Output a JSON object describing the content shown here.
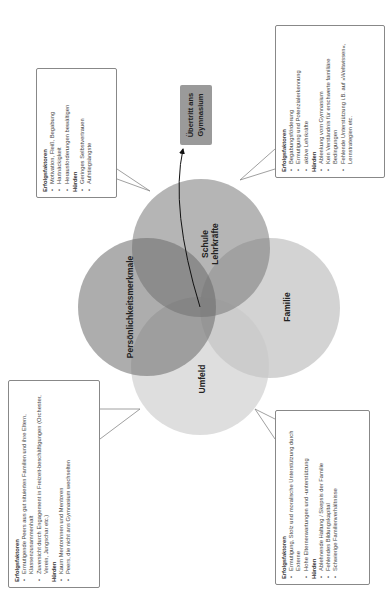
{
  "diagram": {
    "target": "Übertritt ans Gymnasium",
    "target_lines": [
      "Übertritt ans",
      "Gymnasium"
    ],
    "circles": [
      {
        "id": "schule",
        "label_lines": [
          "Schule",
          "Lehrkräfte"
        ]
      },
      {
        "id": "persoenlichkeit",
        "label_lines": [
          "Persönlichkeitsmerkmale"
        ]
      },
      {
        "id": "familie",
        "label_lines": [
          "Familie"
        ]
      },
      {
        "id": "umfeld",
        "label_lines": [
          "Umfeld"
        ]
      }
    ],
    "callouts": {
      "persoenlichkeit": {
        "success_heading": "Erfolgsfaktoren",
        "success": [
          "Motivation, Fleiß, Begabung",
          "Hartnäckigkeit",
          "Herausforderungen bewältigen"
        ],
        "obstacles_heading": "Hürden",
        "obstacles": [
          "Geringes Selbstvertrauen",
          "Aufstiegsängste"
        ]
      },
      "schule": {
        "success_heading": "Erfolgsfaktoren",
        "success": [
          "Begabungsförderung",
          "Ermutigung und Potenzialerkennung",
          "aktive Lehrkräfte"
        ],
        "obstacles_heading": "Hürden",
        "obstacles": [
          "Ablenkung vom Gymnasium",
          "Kein Verständnis für erschwerte familiäre Bedingungen",
          "Fehlende Unterstützung i.B. auf »Weltwissen«, Lernstrategien etc."
        ]
      },
      "umfeld": {
        "success_heading": "Erfolgsfaktoren",
        "success": [
          "Ermutigende Peers aus gut situierten Familien und ihre Eltern, Klassenzusammenhalt",
          "Zuversicht durch Engagement in Freizeit-beschäftigungen (Orchester, Verein, Jungschar etc.)"
        ],
        "obstacles_heading": "Hürden",
        "obstacles": [
          "Kaum Mentorinnen und Mentoren",
          "Peers, die nicht ans Gymnasium wechselten"
        ]
      },
      "familie": {
        "success_heading": "Erfolgsfaktoren",
        "success": [
          "Ermutigung, Stolz und moralische Unterstützung durch Externe",
          "Hohe Elternerwartungen und -unterstützung"
        ],
        "obstacles_heading": "Hürden",
        "obstacles": [
          "Ablehnende Haltung / Skepsis der Familie",
          "Fehlendes Bildungskapital",
          "Schwierige Familienverhältnisse"
        ]
      }
    },
    "colors": {
      "schule": "#8f8f8f",
      "persoenlichkeit": "#7a7a7a",
      "familie": "#bdbdbd",
      "umfeld": "#d0d0d0",
      "target_box": "#9a9a9a"
    }
  }
}
